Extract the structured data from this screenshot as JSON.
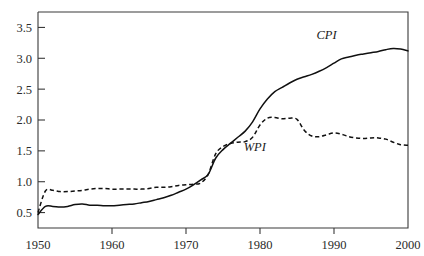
{
  "chart_data": {
    "type": "line",
    "title": "",
    "subtitle": "",
    "xlabel": "",
    "ylabel": "",
    "xlim": [
      1950,
      2000
    ],
    "ylim": [
      0.25,
      3.75
    ],
    "grid": false,
    "legend_position": "inline-annotation",
    "x_ticks": [
      "1950",
      "1960",
      "1970",
      "1980",
      "1990",
      "2000"
    ],
    "x_tick_values": [
      1950,
      1960,
      1970,
      1980,
      1990,
      2000
    ],
    "y_ticks": [
      "0.5",
      "1.0",
      "1.5",
      "2.0",
      "2.5",
      "3.0",
      "3.5"
    ],
    "y_tick_values": [
      0.5,
      1.0,
      1.5,
      2.0,
      2.5,
      3.0,
      3.5
    ],
    "annotations": [
      {
        "text": "CPI",
        "x": 1989.0,
        "y": 3.32
      },
      {
        "text": "WPI",
        "x": 1979.3,
        "y": 1.5
      }
    ],
    "series": [
      {
        "name": "CPI",
        "style": "solid",
        "color": "#101010",
        "x": [
          1950,
          1951,
          1952,
          1953,
          1954,
          1955,
          1956,
          1957,
          1958,
          1959,
          1960,
          1961,
          1962,
          1963,
          1964,
          1965,
          1966,
          1967,
          1968,
          1969,
          1970,
          1971,
          1972,
          1973,
          1974,
          1975,
          1976,
          1977,
          1978,
          1979,
          1980,
          1981,
          1982,
          1983,
          1984,
          1985,
          1986,
          1987,
          1988,
          1989,
          1990,
          1991,
          1992,
          1993,
          1994,
          1995,
          1996,
          1997,
          1998,
          1999,
          2000
        ],
        "values": [
          0.47,
          0.6,
          0.6,
          0.59,
          0.6,
          0.63,
          0.64,
          0.62,
          0.62,
          0.61,
          0.61,
          0.62,
          0.63,
          0.64,
          0.66,
          0.68,
          0.71,
          0.74,
          0.78,
          0.83,
          0.88,
          0.95,
          1.03,
          1.12,
          1.38,
          1.52,
          1.62,
          1.72,
          1.82,
          1.97,
          2.18,
          2.34,
          2.46,
          2.53,
          2.6,
          2.66,
          2.7,
          2.74,
          2.79,
          2.85,
          2.92,
          2.99,
          3.02,
          3.05,
          3.07,
          3.09,
          3.11,
          3.14,
          3.16,
          3.15,
          3.12
        ]
      },
      {
        "name": "WPI",
        "style": "dashed",
        "color": "#101010",
        "x": [
          1950,
          1951,
          1952,
          1953,
          1954,
          1955,
          1956,
          1957,
          1958,
          1959,
          1960,
          1961,
          1962,
          1963,
          1964,
          1965,
          1966,
          1967,
          1968,
          1969,
          1970,
          1971,
          1972,
          1973,
          1974,
          1975,
          1976,
          1977,
          1978,
          1979,
          1980,
          1981,
          1982,
          1983,
          1984,
          1985,
          1986,
          1987,
          1988,
          1989,
          1990,
          1991,
          1992,
          1993,
          1994,
          1995,
          1996,
          1997,
          1998,
          1999,
          2000
        ],
        "values": [
          0.5,
          0.85,
          0.86,
          0.84,
          0.84,
          0.85,
          0.86,
          0.88,
          0.89,
          0.89,
          0.88,
          0.88,
          0.88,
          0.88,
          0.88,
          0.89,
          0.91,
          0.91,
          0.92,
          0.94,
          0.95,
          0.96,
          0.98,
          1.12,
          1.45,
          1.57,
          1.62,
          1.64,
          1.65,
          1.72,
          1.92,
          2.03,
          2.04,
          2.02,
          2.03,
          2.01,
          1.83,
          1.74,
          1.73,
          1.76,
          1.79,
          1.77,
          1.73,
          1.71,
          1.7,
          1.71,
          1.71,
          1.69,
          1.64,
          1.6,
          1.59
        ]
      }
    ]
  }
}
